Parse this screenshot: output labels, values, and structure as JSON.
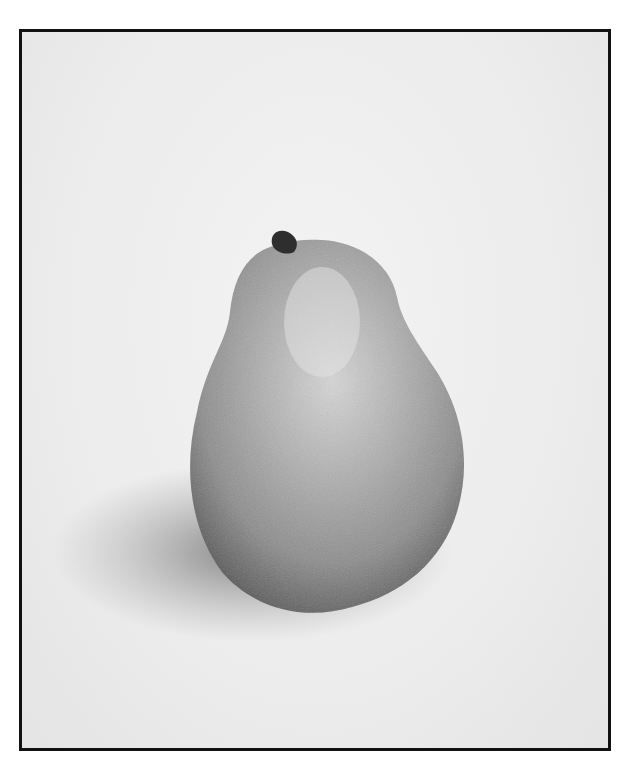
{
  "image": {
    "subject": "pear",
    "style": "grayscale photograph",
    "frame_color": "#111111",
    "background_color": "#eeeeee"
  }
}
